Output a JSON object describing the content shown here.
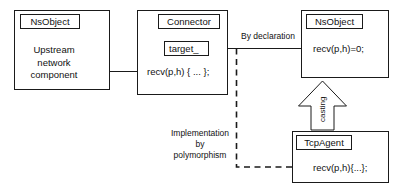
{
  "diagram": {
    "type": "uml-class-interaction-diagram",
    "background_color": "#ffffff",
    "stroke_color": "#1a1a1a",
    "text_color": "#111111"
  },
  "boxes": {
    "upstream": {
      "title": "NsObject",
      "body_line1": "Upstream",
      "body_line2": "network",
      "body_line3": "component"
    },
    "connector": {
      "title": "Connector",
      "attribute": "target_",
      "method": "recv(p,h) { ... };"
    },
    "nsobject_right": {
      "title": "NsObject",
      "method": "recv(p,h)=0;"
    },
    "tcpagent": {
      "title": "TcpAgent",
      "method": "recv(p,h){...};"
    }
  },
  "edges": {
    "by_declaration": "By declaration",
    "implementation_line1": "Implementation",
    "implementation_line2": "by",
    "implementation_line3": "polymorphism",
    "casting": "casting"
  }
}
